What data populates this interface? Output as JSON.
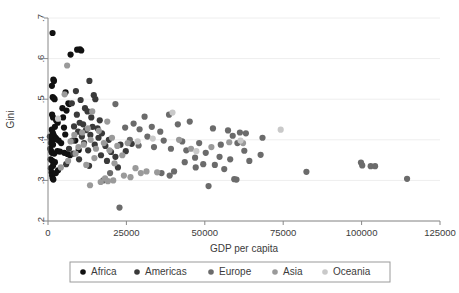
{
  "chart_data": {
    "type": "scatter",
    "title": "",
    "xlabel": "GDP per capita",
    "ylabel": "Gini",
    "xlim": [
      0,
      125000
    ],
    "ylim": [
      0.2,
      0.7
    ],
    "xticks": [
      0,
      25000,
      50000,
      75000,
      100000,
      125000
    ],
    "xticklabels": [
      "0",
      "25000",
      "50000",
      "75000",
      "100000",
      "125000"
    ],
    "yticks": [
      0.2,
      0.3,
      0.4,
      0.5,
      0.6,
      0.7
    ],
    "yticklabels": [
      ".2",
      ".3",
      ".4",
      ".5",
      ".6",
      ".7"
    ],
    "grid": "horizontal",
    "legend_position": "bottom",
    "marker": "circle",
    "marker_size": 3.1,
    "series": [
      {
        "name": "Africa",
        "color": "#111111",
        "points": [
          [
            1450,
            0.663
          ],
          [
            7200,
            0.61
          ],
          [
            9300,
            0.622
          ],
          [
            10200,
            0.623
          ],
          [
            10600,
            0.62
          ],
          [
            1700,
            0.548
          ],
          [
            1900,
            0.545
          ],
          [
            1250,
            0.533
          ],
          [
            1500,
            0.505
          ],
          [
            1800,
            0.503
          ],
          [
            2100,
            0.5
          ],
          [
            5600,
            0.517
          ],
          [
            6500,
            0.49
          ],
          [
            6800,
            0.488
          ],
          [
            5900,
            0.472
          ],
          [
            4600,
            0.478
          ],
          [
            1300,
            0.462
          ],
          [
            1600,
            0.455
          ],
          [
            2600,
            0.448
          ],
          [
            3100,
            0.442
          ],
          [
            2200,
            0.432
          ],
          [
            1200,
            0.425
          ],
          [
            1500,
            0.418
          ],
          [
            1750,
            0.412
          ],
          [
            2000,
            0.408
          ],
          [
            2400,
            0.405
          ],
          [
            1100,
            0.4
          ],
          [
            1350,
            0.396
          ],
          [
            900,
            0.392
          ],
          [
            1600,
            0.388
          ],
          [
            2700,
            0.402
          ],
          [
            3400,
            0.398
          ],
          [
            5100,
            0.43
          ],
          [
            5500,
            0.413
          ],
          [
            4200,
            0.392
          ],
          [
            700,
            0.378
          ],
          [
            1000,
            0.372
          ],
          [
            1250,
            0.368
          ],
          [
            2000,
            0.366
          ],
          [
            3000,
            0.372
          ],
          [
            3800,
            0.371
          ],
          [
            5200,
            0.368
          ],
          [
            6200,
            0.365
          ],
          [
            7000,
            0.362
          ],
          [
            800,
            0.352
          ],
          [
            1400,
            0.348
          ],
          [
            2200,
            0.345
          ],
          [
            1600,
            0.336
          ],
          [
            900,
            0.33
          ],
          [
            1100,
            0.32
          ],
          [
            1300,
            0.312
          ],
          [
            1500,
            0.305
          ],
          [
            1700,
            0.302
          ],
          [
            2500,
            0.318
          ],
          [
            3200,
            0.325
          ],
          [
            600,
            0.408
          ],
          [
            4800,
            0.455
          ],
          [
            8700,
            0.398
          ],
          [
            9800,
            0.375
          ]
        ]
      },
      {
        "name": "Americas",
        "color": "#3a3a3a",
        "points": [
          [
            13200,
            0.545
          ],
          [
            14600,
            0.51
          ],
          [
            15100,
            0.5
          ],
          [
            8900,
            0.52
          ],
          [
            10400,
            0.498
          ],
          [
            7600,
            0.49
          ],
          [
            11800,
            0.478
          ],
          [
            12600,
            0.47
          ],
          [
            9200,
            0.462
          ],
          [
            13800,
            0.455
          ],
          [
            16500,
            0.448
          ],
          [
            10100,
            0.442
          ],
          [
            11200,
            0.438
          ],
          [
            8300,
            0.433
          ],
          [
            14200,
            0.432
          ],
          [
            15800,
            0.428
          ],
          [
            12100,
            0.424
          ],
          [
            9600,
            0.42
          ],
          [
            17200,
            0.416
          ],
          [
            13500,
            0.412
          ],
          [
            10800,
            0.408
          ],
          [
            16100,
            0.405
          ],
          [
            19400,
            0.4
          ],
          [
            7800,
            0.398
          ],
          [
            11500,
            0.392
          ],
          [
            14900,
            0.388
          ],
          [
            18300,
            0.385
          ],
          [
            6700,
            0.378
          ],
          [
            12800,
            0.374
          ],
          [
            20100,
            0.37
          ],
          [
            8100,
            0.366
          ],
          [
            16900,
            0.362
          ],
          [
            21500,
            0.358
          ],
          [
            9900,
            0.352
          ],
          [
            18800,
            0.348
          ],
          [
            5800,
            0.34
          ],
          [
            13100,
            0.336
          ],
          [
            22300,
            0.332
          ],
          [
            24800,
            0.372
          ],
          [
            26700,
            0.39
          ],
          [
            23100,
            0.388
          ]
        ]
      },
      {
        "name": "Europe",
        "color": "#6b6b6b",
        "points": [
          [
            21500,
            0.488
          ],
          [
            30800,
            0.457
          ],
          [
            38600,
            0.462
          ],
          [
            45200,
            0.445
          ],
          [
            27300,
            0.44
          ],
          [
            33100,
            0.432
          ],
          [
            41400,
            0.438
          ],
          [
            24600,
            0.43
          ],
          [
            29200,
            0.426
          ],
          [
            35800,
            0.42
          ],
          [
            52600,
            0.428
          ],
          [
            57400,
            0.423
          ],
          [
            61200,
            0.418
          ],
          [
            63100,
            0.416
          ],
          [
            58900,
            0.41
          ],
          [
            68400,
            0.405
          ],
          [
            31700,
            0.408
          ],
          [
            26100,
            0.4
          ],
          [
            36900,
            0.398
          ],
          [
            42800,
            0.396
          ],
          [
            48200,
            0.392
          ],
          [
            55100,
            0.388
          ],
          [
            60400,
            0.392
          ],
          [
            28900,
            0.386
          ],
          [
            33800,
            0.382
          ],
          [
            39200,
            0.378
          ],
          [
            44100,
            0.374
          ],
          [
            62600,
            0.373
          ],
          [
            50300,
            0.368
          ],
          [
            54700,
            0.358
          ],
          [
            46900,
            0.356
          ],
          [
            58100,
            0.352
          ],
          [
            64200,
            0.348
          ],
          [
            67800,
            0.363
          ],
          [
            43600,
            0.345
          ],
          [
            49500,
            0.34
          ],
          [
            53200,
            0.338
          ],
          [
            47100,
            0.332
          ],
          [
            56200,
            0.328
          ],
          [
            40200,
            0.322
          ],
          [
            36200,
            0.318
          ],
          [
            59400,
            0.303
          ],
          [
            60100,
            0.302
          ],
          [
            38800,
            0.312
          ],
          [
            51200,
            0.286
          ],
          [
            82400,
            0.321
          ],
          [
            99800,
            0.344
          ],
          [
            100200,
            0.337
          ],
          [
            102900,
            0.335
          ],
          [
            104300,
            0.335
          ],
          [
            114500,
            0.304
          ],
          [
            22800,
            0.233
          ],
          [
            19800,
            0.318
          ],
          [
            17600,
            0.3
          ]
        ]
      },
      {
        "name": "Asia",
        "color": "#9a9a9a",
        "points": [
          [
            6100,
            0.583
          ],
          [
            5300,
            0.512
          ],
          [
            14100,
            0.47
          ],
          [
            18900,
            0.445
          ],
          [
            12700,
            0.428
          ],
          [
            16200,
            0.422
          ],
          [
            10900,
            0.418
          ],
          [
            8400,
            0.412
          ],
          [
            20400,
            0.405
          ],
          [
            13600,
            0.4
          ],
          [
            7200,
            0.396
          ],
          [
            17800,
            0.392
          ],
          [
            11400,
            0.388
          ],
          [
            22100,
            0.385
          ],
          [
            9700,
            0.382
          ],
          [
            15300,
            0.378
          ],
          [
            19600,
            0.374
          ],
          [
            25400,
            0.392
          ],
          [
            8800,
            0.366
          ],
          [
            23700,
            0.362
          ],
          [
            14800,
            0.355
          ],
          [
            6400,
            0.348
          ],
          [
            21200,
            0.342
          ],
          [
            12200,
            0.338
          ],
          [
            27900,
            0.33
          ],
          [
            31400,
            0.322
          ],
          [
            34800,
            0.32
          ],
          [
            24200,
            0.312
          ],
          [
            18200,
            0.305
          ],
          [
            19100,
            0.298
          ],
          [
            16800,
            0.296
          ],
          [
            20800,
            0.3
          ],
          [
            26300,
            0.308
          ],
          [
            29600,
            0.318
          ],
          [
            4100,
            0.332
          ],
          [
            13400,
            0.288
          ],
          [
            41800,
            0.4
          ],
          [
            57800,
            0.394
          ],
          [
            62200,
            0.392
          ],
          [
            45600,
            0.378
          ],
          [
            52100,
            0.382
          ]
        ]
      },
      {
        "name": "Oceania",
        "color": "#c9c9c9",
        "points": [
          [
            39700,
            0.467
          ],
          [
            74200,
            0.425
          ],
          [
            33400,
            0.403
          ],
          [
            61400,
            0.398
          ],
          [
            47300,
            0.372
          ],
          [
            3200,
            0.452
          ],
          [
            28600,
            0.396
          ]
        ]
      }
    ]
  },
  "legend": {
    "items": [
      {
        "label": "Africa",
        "color": "#111111"
      },
      {
        "label": "Americas",
        "color": "#3a3a3a"
      },
      {
        "label": "Europe",
        "color": "#6b6b6b"
      },
      {
        "label": "Asia",
        "color": "#9a9a9a"
      },
      {
        "label": "Oceania",
        "color": "#c9c9c9"
      }
    ]
  },
  "style": {
    "background": "#ffffff",
    "gridline_color": "#eeeeee",
    "axis_color": "#888888",
    "text_color": "#3b3b3b",
    "legend_border_color": "#9a9a9a"
  }
}
